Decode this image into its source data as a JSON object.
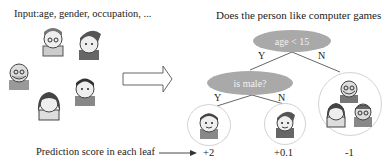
{
  "input_label": "Input:age, gender, occupation, ...",
  "tree_title": "Does the person like computer games",
  "tree": {
    "root": {
      "label": "age < 15",
      "yes": "Y",
      "no": "N"
    },
    "child": {
      "label": "is male?",
      "yes": "Y",
      "no": "N"
    }
  },
  "leaves": [
    {
      "id": "leaf-1",
      "people": [
        "boy"
      ],
      "score": "+2"
    },
    {
      "id": "leaf-2",
      "people": [
        "girl-ponytail"
      ],
      "score": "+0.1"
    },
    {
      "id": "leaf-3",
      "people": [
        "grandpa",
        "young-woman",
        "grandma"
      ],
      "score": "-1"
    }
  ],
  "input_people": [
    "grandma",
    "girl-ponytail",
    "grandpa",
    "boy",
    "young-woman"
  ],
  "prediction_label": "Prediction score in each leaf",
  "colors": {
    "node_fill": "#a9a9a9",
    "node_text": "#f2f2f2",
    "leaf_border": "#d4d4d4"
  }
}
